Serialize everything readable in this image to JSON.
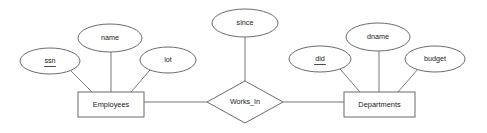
{
  "diagram": {
    "type": "entity-relationship-diagram",
    "background_color": "#ffffff",
    "line_color": "#5a5a5a",
    "text_color": "#1a1a1a"
  },
  "entities": [
    {
      "id": "employees",
      "label": "Employees",
      "shape": "rectangle",
      "x": 78,
      "y": 92,
      "width": 66,
      "height": 25
    },
    {
      "id": "departments",
      "label": "Departments",
      "shape": "rectangle",
      "x": 344,
      "y": 92,
      "width": 71,
      "height": 25
    }
  ],
  "relationships": [
    {
      "id": "works_in",
      "label": "Works_In",
      "shape": "diamond",
      "cx": 245,
      "cy": 102,
      "rx": 38,
      "ry": 21
    }
  ],
  "attributes": [
    {
      "id": "ssn",
      "label": "ssn",
      "owner": "employees",
      "primary_key": true,
      "cx": 50,
      "cy": 61,
      "rx": 30,
      "ry": 13
    },
    {
      "id": "name",
      "label": "name",
      "owner": "employees",
      "primary_key": false,
      "cx": 110,
      "cy": 38,
      "rx": 32,
      "ry": 14
    },
    {
      "id": "lot",
      "label": "lot",
      "owner": "employees",
      "primary_key": false,
      "cx": 168,
      "cy": 60,
      "rx": 28,
      "ry": 13
    },
    {
      "id": "since",
      "label": "since",
      "owner": "works_in",
      "primary_key": false,
      "cx": 245,
      "cy": 23,
      "rx": 33,
      "ry": 14
    },
    {
      "id": "did",
      "label": "did",
      "owner": "departments",
      "primary_key": true,
      "cx": 320,
      "cy": 59,
      "rx": 31,
      "ry": 13
    },
    {
      "id": "dname",
      "label": "dname",
      "owner": "departments",
      "primary_key": false,
      "cx": 378,
      "cy": 37,
      "rx": 32,
      "ry": 14
    },
    {
      "id": "budget",
      "label": "budget",
      "owner": "departments",
      "primary_key": false,
      "cx": 435,
      "cy": 59,
      "rx": 30,
      "ry": 13
    }
  ],
  "connectors": [
    {
      "id": "ssn-employees",
      "x1": 71,
      "y1": 71,
      "x2": 92,
      "y2": 92
    },
    {
      "id": "name-employees",
      "x1": 111,
      "y1": 52,
      "x2": 111,
      "y2": 92
    },
    {
      "id": "lot-employees",
      "x1": 150,
      "y1": 70,
      "x2": 131,
      "y2": 92
    },
    {
      "id": "employees-works_in",
      "x1": 144,
      "y1": 102,
      "x2": 207,
      "y2": 102
    },
    {
      "id": "since-works_in",
      "x1": 245,
      "y1": 37,
      "x2": 245,
      "y2": 81
    },
    {
      "id": "works_in-departments",
      "x1": 283,
      "y1": 102,
      "x2": 344,
      "y2": 102
    },
    {
      "id": "did-departments",
      "x1": 340,
      "y1": 69,
      "x2": 360,
      "y2": 92
    },
    {
      "id": "dname-departments",
      "x1": 379,
      "y1": 51,
      "x2": 379,
      "y2": 92
    },
    {
      "id": "budget-departments",
      "x1": 418,
      "y1": 69,
      "x2": 398,
      "y2": 92
    }
  ]
}
